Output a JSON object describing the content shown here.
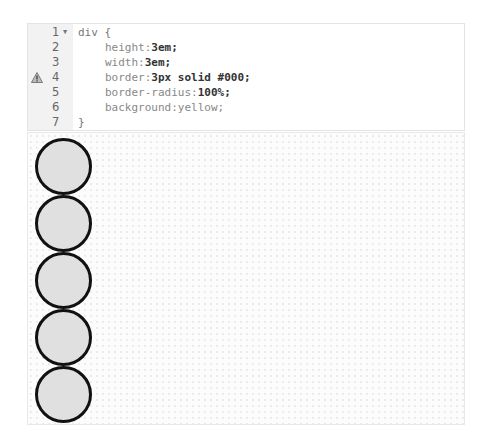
{
  "editor": {
    "lines": [
      {
        "number": "1",
        "fold": true,
        "warning": false,
        "selector": "div {",
        "prop": "",
        "value": ""
      },
      {
        "number": "2",
        "fold": false,
        "warning": false,
        "selector": "",
        "prop": "height:",
        "value": "3em;"
      },
      {
        "number": "3",
        "fold": false,
        "warning": false,
        "selector": "",
        "prop": "width:",
        "value": "3em;"
      },
      {
        "number": "4",
        "fold": false,
        "warning": true,
        "selector": "",
        "prop": "border:",
        "value": "3px solid #000;"
      },
      {
        "number": "5",
        "fold": false,
        "warning": false,
        "selector": "",
        "prop": "border-radius:",
        "value": "100%;"
      },
      {
        "number": "6",
        "fold": false,
        "warning": false,
        "selector": "",
        "prop": "background:",
        "value": "yellow;"
      },
      {
        "number": "7",
        "fold": false,
        "warning": false,
        "selector": "}",
        "prop": "",
        "value": ""
      }
    ],
    "icons": {
      "fold": "fold-arrow-icon",
      "warning": "warning-triangle-icon"
    }
  },
  "preview": {
    "circle_count": 5,
    "circle_fill": "#e0e0e0",
    "circle_border": "#111111"
  }
}
